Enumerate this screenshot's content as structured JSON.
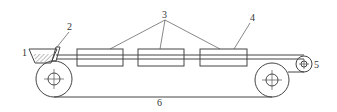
{
  "diagram": {
    "type": "conveyor-belt-schematic",
    "labels": [
      {
        "id": "1",
        "text": "1",
        "refers_to": "hopper"
      },
      {
        "id": "2",
        "text": "2",
        "refers_to": "feed-guide"
      },
      {
        "id": "3",
        "text": "3",
        "refers_to": "processing-units"
      },
      {
        "id": "4",
        "text": "4",
        "refers_to": "processing-unit-cover"
      },
      {
        "id": "5",
        "text": "5",
        "refers_to": "tension-roller"
      },
      {
        "id": "6",
        "text": "6",
        "refers_to": "conveyor-belt"
      }
    ],
    "components": {
      "hopper": {
        "label": "1"
      },
      "guide": {
        "label": "2"
      },
      "units": [
        {
          "label": "3"
        },
        {
          "label": "3"
        },
        {
          "label": "3"
        }
      ],
      "unit_cover": {
        "label": "4"
      },
      "drive_roller_left": {},
      "drive_roller_right": {},
      "tension_roller": {
        "label": "5"
      },
      "belt": {
        "label": "6"
      }
    },
    "colors": {
      "line": "#444444",
      "background": "#ffffff"
    }
  }
}
